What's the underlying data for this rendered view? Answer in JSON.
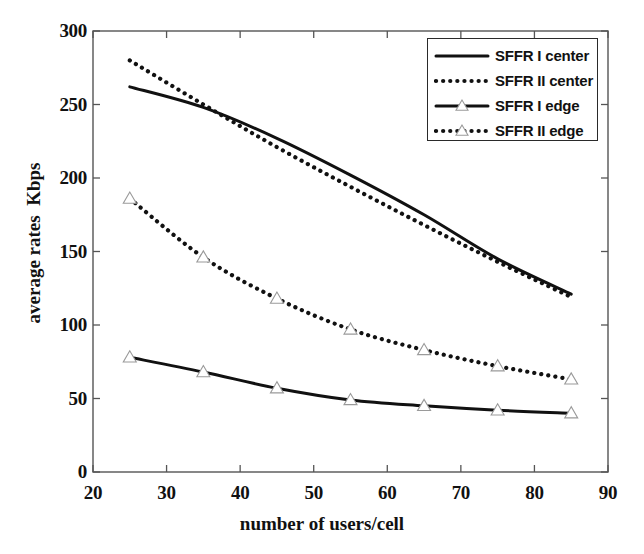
{
  "chart_data": {
    "type": "line",
    "title": "",
    "xlabel": "number of users/cell",
    "ylabel": "average rates  Kbps",
    "xlim": [
      20,
      90
    ],
    "ylim": [
      0,
      300
    ],
    "xticks": [
      20,
      30,
      40,
      50,
      60,
      70,
      80,
      90
    ],
    "yticks": [
      0,
      50,
      100,
      150,
      200,
      250,
      300
    ],
    "xtick_labels": [
      "20",
      "30",
      "40",
      "50",
      "60",
      "70",
      "80",
      "90"
    ],
    "ytick_labels": [
      "0",
      "50",
      "100",
      "150",
      "200",
      "250",
      "300"
    ],
    "grid": false,
    "legend_position": "upper right",
    "x": [
      25,
      35,
      45,
      55,
      65,
      75,
      85
    ],
    "series": [
      {
        "name": "SFFR I center",
        "style": "solid",
        "marker": "none",
        "color": "#111111",
        "values": [
          262,
          248,
          227,
          202,
          175,
          145,
          121
        ]
      },
      {
        "name": "SFFR II center",
        "style": "dotted",
        "marker": "none",
        "color": "#111111",
        "values": [
          280,
          250,
          221,
          194,
          168,
          143,
          119
        ]
      },
      {
        "name": "SFFR I edge",
        "style": "solid",
        "marker": "triangle",
        "color": "#111111",
        "values": [
          78,
          68,
          57,
          49,
          45,
          42,
          40
        ]
      },
      {
        "name": "SFFR II edge",
        "style": "dotted",
        "marker": "triangle",
        "color": "#111111",
        "values": [
          186,
          146,
          118,
          97,
          83,
          72,
          63
        ]
      }
    ]
  },
  "legend": {
    "entries": [
      {
        "label": "SFFR I center"
      },
      {
        "label": "SFFR II center"
      },
      {
        "label": "SFFR I edge"
      },
      {
        "label": "SFFR II edge"
      }
    ]
  },
  "axes": {
    "x_title": "number of users/cell",
    "y_title": "average rates  Kbps"
  },
  "colors": {
    "ink": "#111111",
    "axis": "#555555",
    "background": "#ffffff"
  }
}
